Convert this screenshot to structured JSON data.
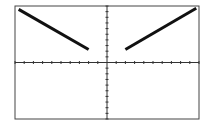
{
  "chart_data": {
    "type": "line",
    "title": "",
    "xlabel": "",
    "ylabel": "",
    "xlim": [
      -10,
      10
    ],
    "ylim": [
      -10,
      10
    ],
    "x_tick_step": 1,
    "y_tick_step": 1,
    "grid": false,
    "legend": null,
    "series": [
      {
        "name": "left branch",
        "x": [
          -9.6,
          -2
        ],
        "y": [
          9.4,
          2.3
        ]
      },
      {
        "name": "right branch",
        "x": [
          2,
          9.7
        ],
        "y": [
          2.3,
          9.6
        ]
      }
    ]
  },
  "colors": {
    "line": "#111111",
    "axis": "#333333",
    "frame": "#444444",
    "background": "#ffffff"
  }
}
